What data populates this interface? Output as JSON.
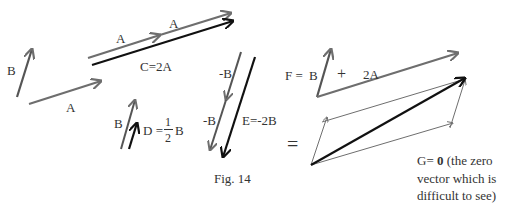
{
  "figure": {
    "caption": "Fig. 14",
    "labels": {
      "b_left": "B",
      "a_bottom": "A",
      "a_first": "A",
      "a_second": "A",
      "c": "C=2A",
      "b_small": "B",
      "d_prefix": "D =",
      "d_num": "1",
      "d_den": "2",
      "d_suffix": "B",
      "neg_b_top": "-B",
      "neg_b_bottom": "-B",
      "e": "E=-2B",
      "f_prefix": "F =",
      "f_b": "B",
      "f_plus": "+",
      "f_2a": "2A",
      "equals": "=",
      "g_line1_prefix": "G=",
      "g_line1_bold": "0",
      "g_line1_suffix": "(the zero",
      "g_line2": "vector which is",
      "g_line3": "difficult to see)"
    },
    "colors": {
      "gray_vector": "#6e6e6e",
      "black_vector": "#111111",
      "text": "#333333"
    }
  }
}
